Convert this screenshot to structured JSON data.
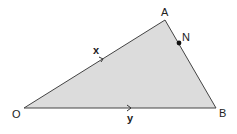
{
  "diagram": {
    "type": "vector-triangle",
    "fill_color": "#dcdcdc",
    "stroke_color": "#444444",
    "vertices": {
      "O": {
        "label": "O"
      },
      "A": {
        "label": "A"
      },
      "B": {
        "label": "B"
      }
    },
    "point_N": {
      "label": "N",
      "on_segment": "AB"
    },
    "vectors": {
      "OA": {
        "label": "x"
      },
      "OB": {
        "label": "y"
      }
    }
  }
}
